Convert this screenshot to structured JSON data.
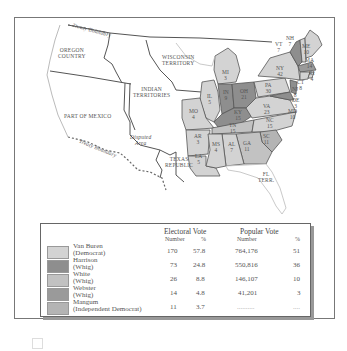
{
  "map": {
    "title": "Election of 1836",
    "region_labels": [
      {
        "name": "oregon-country",
        "text": "OREGON\nCOUNTRY"
      },
      {
        "name": "wisconsin-territory",
        "text": "WISCONSIN\nTERRITORY"
      },
      {
        "name": "indian-territories",
        "text": "INDIAN\nTERRITORIES"
      },
      {
        "name": "part-of-mexico",
        "text": "PART OF MEXICO"
      },
      {
        "name": "disputed-area",
        "text": "Disputed\nArea"
      },
      {
        "name": "texas-republic",
        "text": "TEXAS\nREPUBLIC"
      },
      {
        "name": "fl-terr",
        "text": "FL\nTERR."
      }
    ],
    "boundary_labels": {
      "north": "Treaty Boundary",
      "south": "Treaty Boundary"
    },
    "states": [
      {
        "abbr": "NH",
        "ev": "7",
        "party": "van_buren"
      },
      {
        "abbr": "VT",
        "ev": "7",
        "party": "harrison"
      },
      {
        "abbr": "ME",
        "ev": "10",
        "party": "van_buren"
      },
      {
        "abbr": "MA",
        "ev": "14",
        "party": "webster"
      },
      {
        "abbr": "RI",
        "ev": "4",
        "party": "van_buren"
      },
      {
        "abbr": "CT",
        "ev": "8",
        "party": "van_buren"
      },
      {
        "abbr": "NY",
        "ev": "42",
        "party": "van_buren"
      },
      {
        "abbr": "NJ",
        "ev": "8",
        "party": "harrison"
      },
      {
        "abbr": "PA",
        "ev": "30",
        "party": "van_buren"
      },
      {
        "abbr": "DE",
        "ev": "3",
        "party": "harrison"
      },
      {
        "abbr": "MD",
        "ev": "10",
        "party": "harrison"
      },
      {
        "abbr": "MI",
        "ev": "3",
        "party": "van_buren"
      },
      {
        "abbr": "OH",
        "ev": "21",
        "party": "harrison"
      },
      {
        "abbr": "IN",
        "ev": "9",
        "party": "harrison"
      },
      {
        "abbr": "IL",
        "ev": "5",
        "party": "van_buren"
      },
      {
        "abbr": "MO",
        "ev": "4",
        "party": "van_buren"
      },
      {
        "abbr": "KY",
        "ev": "15",
        "party": "harrison"
      },
      {
        "abbr": "VA",
        "ev": "23",
        "party": "van_buren"
      },
      {
        "abbr": "NC",
        "ev": "15",
        "party": "van_buren"
      },
      {
        "abbr": "TN",
        "ev": "15",
        "party": "white"
      },
      {
        "abbr": "SC",
        "ev": "11",
        "party": "mangum"
      },
      {
        "abbr": "GA",
        "ev": "11",
        "party": "white"
      },
      {
        "abbr": "AL",
        "ev": "7",
        "party": "van_buren"
      },
      {
        "abbr": "MS",
        "ev": "4",
        "party": "van_buren"
      },
      {
        "abbr": "AR",
        "ev": "3",
        "party": "van_buren"
      },
      {
        "abbr": "LA",
        "ev": "5",
        "party": "van_buren"
      }
    ]
  },
  "legend": {
    "electoral_header": "Electoral Vote",
    "popular_header": "Popular Vote",
    "col_number": "Number",
    "col_percent": "%",
    "rows": [
      {
        "name": "Van Buren",
        "party": "(Democrat)",
        "ev": "170",
        "ev_pct": "57.8",
        "pv": "764,176",
        "pv_pct": "51",
        "color": "#d3d3d3"
      },
      {
        "name": "Harrison",
        "party": "(Whig)",
        "ev": "73",
        "ev_pct": "24.8",
        "pv": "550,816",
        "pv_pct": "36",
        "color": "#8e8e8e"
      },
      {
        "name": "White",
        "party": "(Whig)",
        "ev": "26",
        "ev_pct": "8.8",
        "pv": "146,107",
        "pv_pct": "10",
        "color": "#c2c2c2"
      },
      {
        "name": "Webster",
        "party": "(Whig)",
        "ev": "14",
        "ev_pct": "4.8",
        "pv": "41,201",
        "pv_pct": "3",
        "color": "#9a9a9a"
      },
      {
        "name": "Mangum",
        "party": "(Independent Democrat)",
        "ev": "11",
        "ev_pct": "3.7",
        "pv": "..........",
        "pv_pct": "....",
        "color": "#b4b4b4"
      }
    ]
  },
  "colors": {
    "van_buren": "#d3d3d3",
    "harrison": "#8e8e8e",
    "white": "#c2c2c2",
    "webster": "#9a9a9a",
    "mangum": "#b4b4b4",
    "border": "#555555"
  }
}
